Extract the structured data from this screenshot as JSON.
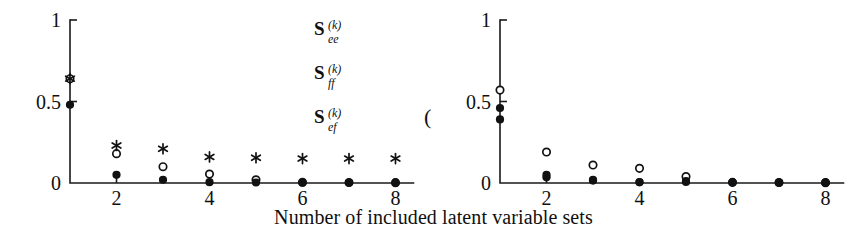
{
  "figure": {
    "caption": "Number of included latent variable sets",
    "panels": [
      "left",
      "right"
    ]
  },
  "axes": {
    "y_ticks": [
      "0",
      "0.5",
      "1"
    ],
    "y_tick_values": [
      0,
      0.5,
      1
    ],
    "x_ticks": [
      "2",
      "4",
      "6",
      "8"
    ],
    "x_tick_values": [
      2,
      4,
      6,
      8
    ],
    "xlim": [
      0.55,
      8.45
    ],
    "ylim": [
      0,
      1
    ],
    "grid": false
  },
  "legend": {
    "position": "top-right of left panel",
    "entries": [
      {
        "marker": "open-circle-icon",
        "symbol": "S",
        "subscript": "ee",
        "superscript": "(k)"
      },
      {
        "marker": "asterisk-icon",
        "symbol": "S",
        "subscript": "ff",
        "superscript": "(k)"
      },
      {
        "marker": "filled-dot-icon",
        "symbol": "S",
        "subscript": "ef",
        "superscript": "(k)"
      }
    ]
  },
  "chart_data": [
    {
      "type": "scatter",
      "panel": "left",
      "title": "",
      "xlabel": "Number of included latent variable sets",
      "ylabel": "",
      "x": [
        1,
        2,
        3,
        4,
        5,
        6,
        7,
        8
      ],
      "xlim": [
        0.55,
        8.45
      ],
      "ylim": [
        0,
        1
      ],
      "grid": false,
      "series": [
        {
          "name": "S_ee^(k)",
          "marker": "open-circle",
          "values": [
            0.64,
            0.18,
            0.1,
            0.055,
            0.02,
            0.005,
            0.003,
            0.002
          ]
        },
        {
          "name": "S_ff^(k)",
          "marker": "asterisk",
          "values": [
            0.64,
            0.23,
            0.21,
            0.16,
            0.155,
            0.15,
            0.15,
            0.15
          ]
        },
        {
          "name": "S_ef^(k)",
          "marker": "filled-dot",
          "values": [
            0.48,
            0.05,
            0.02,
            0.005,
            0.003,
            0.002,
            0.002,
            0.002
          ]
        }
      ]
    },
    {
      "type": "scatter",
      "panel": "right",
      "title": "",
      "xlabel": "Number of included latent variable sets",
      "ylabel": "",
      "x": [
        1,
        2,
        3,
        4,
        5,
        6,
        7,
        8
      ],
      "xlim": [
        0.55,
        8.45
      ],
      "ylim": [
        0,
        1
      ],
      "grid": false,
      "series": [
        {
          "name": "S_ee^(k)",
          "marker": "open-circle",
          "values": [
            0.57,
            0.19,
            0.11,
            0.09,
            0.04,
            0.004,
            0.003,
            0.002
          ]
        },
        {
          "name": "S_ff^(k)",
          "marker": "filled-dot",
          "values": [
            0.46,
            0.05,
            0.02,
            0.006,
            0.012,
            0.004,
            0.003,
            0.002
          ]
        },
        {
          "name": "S_ef^(k)",
          "marker": "filled-dot",
          "values": [
            0.39,
            0.035,
            0.015,
            0.004,
            0.006,
            0.003,
            0.002,
            0.002
          ]
        }
      ]
    }
  ]
}
